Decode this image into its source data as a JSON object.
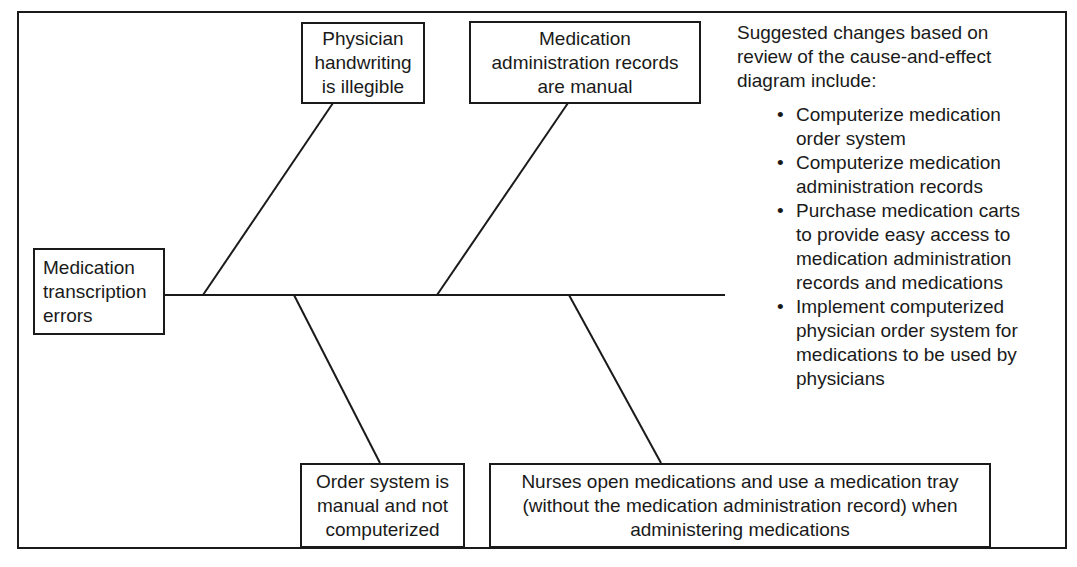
{
  "diagram": {
    "type": "cause-and-effect (fishbone)",
    "effect": {
      "lines": [
        "Medication",
        "transcription",
        "errors"
      ]
    },
    "causes": [
      {
        "position": "top-left",
        "lines": [
          "Physician",
          "handwriting",
          "is illegible"
        ]
      },
      {
        "position": "top-right",
        "lines": [
          "Medication",
          "administration records",
          "are manual"
        ]
      },
      {
        "position": "bottom-left",
        "lines": [
          "Order system is",
          "manual and not",
          "computerized"
        ]
      },
      {
        "position": "bottom-right",
        "lines": [
          "Nurses open medications and use a medication tray",
          "(without the medication administration record) when",
          "administering medications"
        ]
      }
    ],
    "suggestions": {
      "intro_lines": [
        "Suggested changes based on",
        "review of the cause-and-effect",
        "diagram include:"
      ],
      "bullet_glyph": "•",
      "items": [
        {
          "lines": [
            "Computerize medication",
            "order system"
          ]
        },
        {
          "lines": [
            "Computerize medication",
            "administration records"
          ]
        },
        {
          "lines": [
            "Purchase medication carts",
            "to provide easy access to",
            "medication administration",
            "records and medications"
          ]
        },
        {
          "lines": [
            "Implement computerized",
            "physician order system for",
            "medications to be used by",
            "physicians"
          ]
        }
      ]
    },
    "colors": {
      "line": "#1a1a1a",
      "background": "#ffffff"
    }
  }
}
